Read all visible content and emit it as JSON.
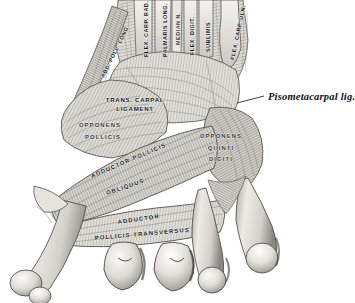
{
  "figure": {
    "domain": "anatomical-illustration",
    "background_color": "#ffffff",
    "ink_color": "#2a2a2a",
    "label_color": "#16181a",
    "width": 355,
    "height": 303
  },
  "labels": {
    "abd_poll_long": "ABD. POLL. LONG.",
    "flex_carp_rad": "FLEX. CARP. RAD.",
    "palmaris_long": "PALMARIS LONG.",
    "median_n": "MEDIAN N.",
    "flex_digit": "FLEX. DIGIT.",
    "sublimis": "SUBLIMIS",
    "flex_carp_uln": "FLEX. CARP. ULN.",
    "trans_carpal_line1": "TRANS. CARPAL",
    "trans_carpal_line2": "LIGAMENT",
    "opponens_pollicis_line1": "OPPONENS",
    "opponens_pollicis_line2": "POLLICIS",
    "opponens_quinti_line1": "OPPONENS",
    "opponens_quinti_line2": "QUINTI",
    "opponens_quinti_line3": "DIGITI",
    "adductor_pollicis": "ADDUCTOR POLLICIS",
    "obliquus": "OBLIQUUS",
    "adductor": "ADDUCTOR",
    "pollicis_transversus": "POLLICIS TRANSVERSUS",
    "pisometacarpal": "Pisometacarpal lig."
  },
  "callout": {
    "text": "Pisometacarpal lig.",
    "leader_from_x": 237,
    "leader_from_y": 103,
    "leader_to_x": 264,
    "leader_to_y": 96
  },
  "palette": {
    "paper": "#ffffff",
    "muscle_light": "#e8e6e2",
    "muscle_mid": "#c9c6c1",
    "muscle_dark": "#9b9791",
    "muscle_deep": "#6f6b66",
    "shadow": "#4a4744",
    "bone_light": "#f2f0ec",
    "bone_mid": "#d8d5d0",
    "outline": "#3a3836"
  }
}
